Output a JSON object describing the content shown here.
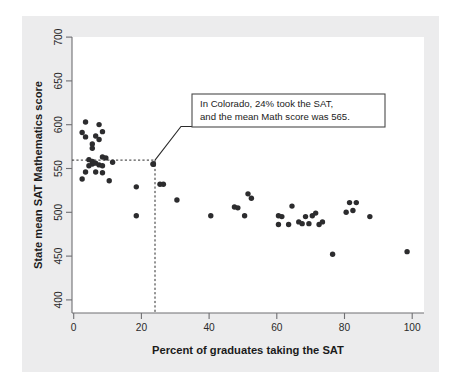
{
  "chart_data": {
    "type": "scatter",
    "title": "",
    "xlabel": "Percent of graduates taking the SAT",
    "ylabel": "State mean SAT Mathematics score",
    "xlim": [
      0,
      104
    ],
    "ylim": [
      395,
      710
    ],
    "xticks": [
      0,
      20,
      40,
      60,
      80,
      100
    ],
    "yticks": [
      400,
      450,
      500,
      550,
      600,
      650,
      700
    ],
    "grid": false,
    "legend": null,
    "marker_color": "#2c2c2e",
    "points": [
      {
        "x": 4,
        "y": 613
      },
      {
        "x": 8,
        "y": 610
      },
      {
        "x": 3,
        "y": 601
      },
      {
        "x": 9,
        "y": 602
      },
      {
        "x": 4,
        "y": 596
      },
      {
        "x": 7,
        "y": 597
      },
      {
        "x": 8,
        "y": 593
      },
      {
        "x": 6,
        "y": 588
      },
      {
        "x": 6,
        "y": 583
      },
      {
        "x": 9,
        "y": 573
      },
      {
        "x": 10,
        "y": 572
      },
      {
        "x": 5,
        "y": 570
      },
      {
        "x": 6,
        "y": 568
      },
      {
        "x": 12,
        "y": 567
      },
      {
        "x": 6,
        "y": 565
      },
      {
        "x": 7,
        "y": 566
      },
      {
        "x": 8,
        "y": 564
      },
      {
        "x": 9,
        "y": 563
      },
      {
        "x": 5,
        "y": 563
      },
      {
        "x": 24,
        "y": 565
      },
      {
        "x": 4,
        "y": 556
      },
      {
        "x": 7,
        "y": 556
      },
      {
        "x": 9,
        "y": 555
      },
      {
        "x": 3,
        "y": 548
      },
      {
        "x": 11,
        "y": 546
      },
      {
        "x": 19,
        "y": 539
      },
      {
        "x": 26,
        "y": 542
      },
      {
        "x": 27,
        "y": 542
      },
      {
        "x": 31,
        "y": 524
      },
      {
        "x": 19,
        "y": 506
      },
      {
        "x": 41,
        "y": 506
      },
      {
        "x": 48,
        "y": 516
      },
      {
        "x": 49,
        "y": 515
      },
      {
        "x": 51,
        "y": 506
      },
      {
        "x": 52,
        "y": 531
      },
      {
        "x": 53,
        "y": 526
      },
      {
        "x": 61,
        "y": 506
      },
      {
        "x": 62,
        "y": 505
      },
      {
        "x": 61,
        "y": 496
      },
      {
        "x": 64,
        "y": 496
      },
      {
        "x": 65,
        "y": 517
      },
      {
        "x": 67,
        "y": 499
      },
      {
        "x": 68,
        "y": 497
      },
      {
        "x": 69,
        "y": 505
      },
      {
        "x": 70,
        "y": 497
      },
      {
        "x": 71,
        "y": 506
      },
      {
        "x": 72,
        "y": 509
      },
      {
        "x": 73,
        "y": 496
      },
      {
        "x": 74,
        "y": 499
      },
      {
        "x": 77,
        "y": 462
      },
      {
        "x": 81,
        "y": 510
      },
      {
        "x": 82,
        "y": 521
      },
      {
        "x": 83,
        "y": 512
      },
      {
        "x": 84,
        "y": 521
      },
      {
        "x": 88,
        "y": 505
      },
      {
        "x": 99,
        "y": 465
      }
    ],
    "annotation": {
      "line1": "In Colorado, 24% took the SAT,",
      "line2": "and the mean Math score was 565.",
      "target_x": 24,
      "target_y": 565
    },
    "reference_lines": {
      "vertical_x": 24,
      "horizontal_y": 565,
      "style": "dashed"
    }
  }
}
